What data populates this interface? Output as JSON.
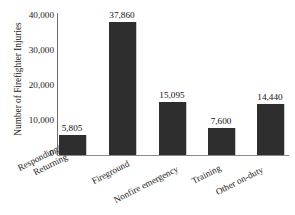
{
  "chart_data": {
    "type": "bar",
    "title": "",
    "xlabel": "",
    "ylabel": "Number of Firefighter Injuries",
    "categories": [
      "Responding/ Returning",
      "Fireground",
      "Nonfire emergency",
      "Training",
      "Other on-duty"
    ],
    "category_lines": [
      [
        "Responding/",
        "Returning"
      ],
      [
        "Fireground"
      ],
      [
        "Nonfire emergency"
      ],
      [
        "Training"
      ],
      [
        "Other on-duty"
      ]
    ],
    "values": [
      5805,
      15095,
      37860,
      7600,
      14440
    ],
    "value_labels": [
      "5,805",
      "37,860",
      "15,095",
      "7,600",
      "14,440"
    ],
    "bar_values_in_order": [
      5805,
      37860,
      15095,
      7600,
      14440
    ],
    "ylim": [
      0,
      40000
    ],
    "yticks": [
      0,
      10000,
      20000,
      30000,
      40000
    ],
    "ytick_labels": [
      "40,000",
      "30,000",
      "20,000",
      "10,000",
      "0"
    ],
    "grid": false,
    "legend": false,
    "bar_color": "#2e2e2e",
    "axis_color": "#6e6e6e",
    "background": "#ffffff"
  },
  "axis": {
    "y_title": "Number of Firefighter Injuries"
  },
  "bars": [
    {
      "label": "5,805",
      "category_l1": "Responding/",
      "category_l2": "Returning"
    },
    {
      "label": "37,860",
      "category_l1": "Fireground",
      "category_l2": ""
    },
    {
      "label": "15,095",
      "category_l1": "Nonfire emergency",
      "category_l2": ""
    },
    {
      "label": "7,600",
      "category_l1": "Training",
      "category_l2": ""
    },
    {
      "label": "14,440",
      "category_l1": "Other on-duty",
      "category_l2": ""
    }
  ]
}
